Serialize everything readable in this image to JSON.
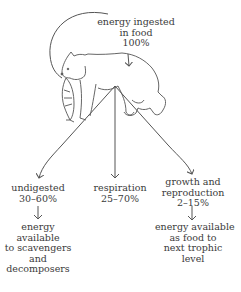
{
  "diagram": {
    "type": "energy-flow",
    "source": {
      "lines": [
        "energy ingested",
        "in food",
        "100%"
      ]
    },
    "illustration": "bear holding fish in mouth",
    "branches": [
      {
        "lines": [
          "undigested",
          "30–60%"
        ],
        "outcome": [
          "energy",
          "available",
          "to scavengers",
          "and",
          "decomposers"
        ]
      },
      {
        "lines": [
          "respiration",
          "25–70%"
        ]
      },
      {
        "lines": [
          "growth and",
          "reproduction",
          "2–15%"
        ],
        "outcome": [
          "energy available",
          "as food to",
          "next trophic",
          "level"
        ]
      }
    ]
  }
}
